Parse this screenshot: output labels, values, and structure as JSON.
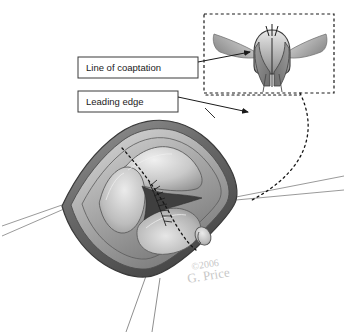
{
  "figure": {
    "background_color": "#ffffff",
    "line_color": "#2b2b2b",
    "tissue_light": "#e2e2e2",
    "tissue_mid": "#b4b4b4",
    "tissue_dark": "#8a8a8a",
    "tissue_darkest": "#5d5d5d",
    "annulus_color": "#6f6f6f"
  },
  "labels": [
    {
      "id": "line-of-coaptation",
      "text": "Line of coaptation",
      "box": {
        "x": 78,
        "y": 57,
        "width": 120,
        "height": 21
      }
    },
    {
      "id": "leading-edge",
      "text": "Leading edge",
      "box": {
        "x": 78,
        "y": 91,
        "width": 100,
        "height": 21
      }
    }
  ],
  "inset": {
    "id": "cross-section-inset",
    "border_style": "dashed",
    "box": {
      "x": 204,
      "y": 14,
      "width": 130,
      "height": 79
    },
    "description": "Cross-sectional view of valve leaflets meeting at coaptation"
  },
  "signature": {
    "copyright": "©2006",
    "artist": "G. Price"
  },
  "icons": {
    "arrowhead": "arrowhead-icon",
    "dotted_connector": "dotted-connector-icon"
  }
}
